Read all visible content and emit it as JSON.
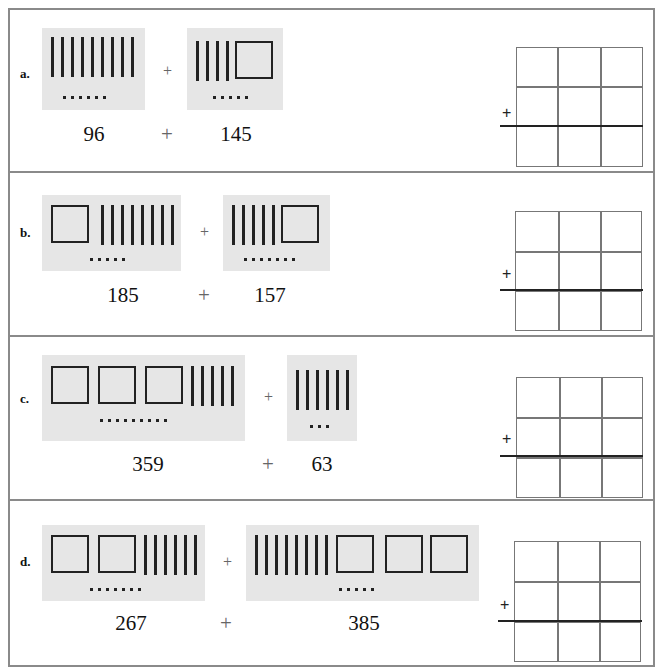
{
  "problems": [
    {
      "label": "a.",
      "addend1": "96",
      "operator": "+",
      "addend2": "145",
      "model1": {
        "hundreds": 0,
        "tens": 9,
        "ones": 6
      },
      "model2": {
        "hundreds": 1,
        "tens": 4,
        "ones": 5
      },
      "grid_plus": "+"
    },
    {
      "label": "b.",
      "addend1": "185",
      "operator": "+",
      "addend2": "157",
      "model1": {
        "hundreds": 1,
        "tens": 8,
        "ones": 5
      },
      "model2": {
        "hundreds": 1,
        "tens": 5,
        "ones": 7
      },
      "grid_plus": "+"
    },
    {
      "label": "c.",
      "addend1": "359",
      "operator": "+",
      "addend2": "63",
      "model1": {
        "hundreds": 3,
        "tens": 5,
        "ones": 9
      },
      "model2": {
        "hundreds": 0,
        "tens": 6,
        "ones": 3
      },
      "grid_plus": "+"
    },
    {
      "label": "d.",
      "addend1": "267",
      "operator": "+",
      "addend2": "385",
      "model1": {
        "hundreds": 2,
        "tens": 6,
        "ones": 7
      },
      "model2": {
        "hundreds": 3,
        "tens": 8,
        "ones": 5
      },
      "grid_plus": "+"
    }
  ],
  "colors": {
    "model_bg": "#e6e6e6",
    "border": "#8a8a8a",
    "grid": "#777777",
    "ink": "#222222"
  }
}
